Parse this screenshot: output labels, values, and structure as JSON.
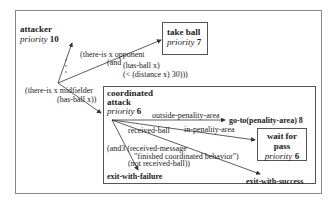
{
  "diagram": {
    "outer_state": {
      "name": "attacker",
      "priority_label": "priority",
      "priority_value": "10"
    },
    "take_ball": {
      "name": "take ball",
      "priority_label": "priority",
      "priority_value": "7"
    },
    "coordinated_attack": {
      "name_line1": "coordinated",
      "name_line2": "attack",
      "priority_label": "priority",
      "priority_value": "6"
    },
    "wait_for_pass": {
      "name_line1": "wait for",
      "name_line2": "pass",
      "priority_label": "priority",
      "priority_value": "6"
    },
    "goto_action": {
      "label": "go-to(penality-area)",
      "priority_value": "8"
    },
    "exits": {
      "failure": "exit-with-failure",
      "success": "exit-with-success"
    },
    "conditions": {
      "opponent_line1": "(there-is x opponent",
      "opponent_line2": "(and",
      "opponent_line3": "(has-ball x)",
      "opponent_line4": "(< (distance x) 30)))",
      "midfielder_line1": "(there-is x midfielder",
      "midfielder_line2": "(has-ball x))",
      "outside": "outside-penality-area",
      "received_ball": "received-ball",
      "in_area": "in-penality-area",
      "and3_line1": "(and3 (received-message",
      "and3_line2": "\"finished coordinated behavior\")",
      "and3_line3": "(not received-ball))"
    },
    "dots": "..."
  }
}
